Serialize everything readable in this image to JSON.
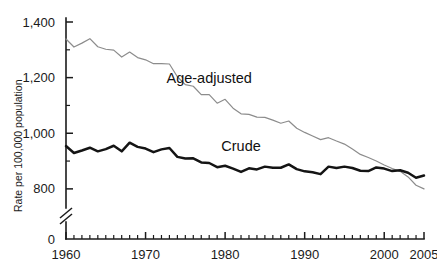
{
  "chart_data": {
    "type": "line",
    "title": "",
    "subtitle": "",
    "xlabel": "",
    "ylabel": "Rate per 100,000 population",
    "xlim": [
      1960,
      2005
    ],
    "ylim": [
      760,
      1400
    ],
    "ylim_display": [
      0,
      1400
    ],
    "axis_break": true,
    "axis_break_note": "y-axis broken between 0 and 760",
    "grid": false,
    "legend_position": "inline-annotation",
    "y_ticks": [
      800,
      1000,
      1200,
      1400
    ],
    "y_tick_labels": [
      "800",
      "1,000",
      "1,200",
      "1,400"
    ],
    "y_zero_label": "0",
    "y_minor_ticks": [
      900,
      1100,
      1300
    ],
    "x_ticks": [
      1960,
      1970,
      1980,
      1990,
      2000,
      2005
    ],
    "x_tick_labels": [
      "1960",
      "1970",
      "1980",
      "1990",
      "2000",
      "2005"
    ],
    "x_minor_tick_interval": 1,
    "x": [
      1960,
      1961,
      1962,
      1963,
      1964,
      1965,
      1966,
      1967,
      1968,
      1969,
      1970,
      1971,
      1972,
      1973,
      1974,
      1975,
      1976,
      1977,
      1978,
      1979,
      1980,
      1981,
      1982,
      1983,
      1984,
      1985,
      1986,
      1987,
      1988,
      1989,
      1990,
      1991,
      1992,
      1993,
      1994,
      1995,
      1996,
      1997,
      1998,
      1999,
      2000,
      2001,
      2002,
      2003,
      2004,
      2005
    ],
    "series": [
      {
        "name": "Age-adjusted",
        "label": "Age-adjusted",
        "color": "#8c8c8c",
        "line_width": 1.2,
        "values": [
          1339,
          1310,
          1324,
          1340,
          1311,
          1302,
          1299,
          1274,
          1292,
          1272,
          1264,
          1250,
          1250,
          1249,
          1203,
          1175,
          1169,
          1139,
          1139,
          1108,
          1122,
          1090,
          1070,
          1068,
          1058,
          1057,
          1047,
          1036,
          1044,
          1018,
          1003,
          990,
          977,
          984,
          972,
          961,
          943,
          924,
          913,
          900,
          886,
          873,
          863,
          843,
          813,
          800
        ]
      },
      {
        "name": "Crude",
        "label": "Crude",
        "color": "#141414",
        "line_width": 2.5,
        "values": [
          954,
          929,
          938,
          948,
          935,
          943,
          955,
          935,
          966,
          951,
          945,
          932,
          942,
          947,
          915,
          909,
          910,
          895,
          893,
          878,
          883,
          873,
          861,
          874,
          870,
          880,
          876,
          876,
          888,
          871,
          863,
          860,
          853,
          880,
          875,
          880,
          875,
          865,
          864,
          877,
          873,
          864,
          867,
          858,
          840,
          848
        ]
      }
    ],
    "annotations": [
      {
        "text": "Age-adjusted",
        "x": 1978,
        "y": 1180
      },
      {
        "text": "Crude",
        "x": 1982,
        "y": 935
      }
    ]
  },
  "axis": {
    "y_title": "Rate per 100,000 population"
  }
}
